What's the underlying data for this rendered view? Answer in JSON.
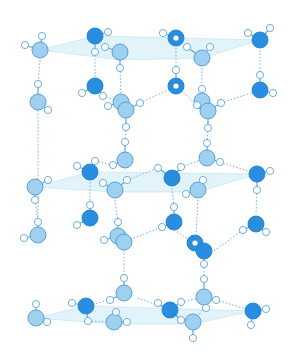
{
  "diagram": {
    "title": "",
    "colors": {
      "oxygen_light": "#9fd0ef",
      "oxygen_dark": "#2a8ee0",
      "hydrogen": "#ffffff",
      "bond_stroke": "#5ea6dd",
      "hbond_dashed": "#7fb3dc",
      "plane_fill": "#bfe6f5"
    },
    "planes": [
      {
        "points": "40,50 95,36 260,40 202,58 120,60"
      },
      {
        "points": "35,187 90,172 257,174 198,192 115,192"
      },
      {
        "points": "36,318 86,306 253,311 193,324 114,324"
      }
    ],
    "molecules": [
      {
        "id": "A1",
        "kind": "light",
        "o": [
          40,
          50
        ],
        "h": [
          [
            25,
            45
          ],
          [
            42,
            36
          ]
        ]
      },
      {
        "id": "A2",
        "kind": "dark",
        "o": [
          95,
          36
        ],
        "h": [
          [
            108,
            32
          ],
          [
            95,
            52
          ]
        ]
      },
      {
        "id": "A3",
        "kind": "light",
        "o": [
          120,
          52
        ],
        "h": [
          [
            105,
            47
          ],
          [
            120,
            68
          ]
        ]
      },
      {
        "id": "A4",
        "kind": "dark",
        "o": [
          176,
          38
        ],
        "h": [
          [
            163,
            33
          ]
        ],
        "hole": true
      },
      {
        "id": "A5",
        "kind": "light",
        "o": [
          202,
          58
        ],
        "h": [
          [
            187,
            47
          ],
          [
            210,
            47
          ]
        ]
      },
      {
        "id": "A6",
        "kind": "dark",
        "o": [
          260,
          40
        ],
        "h": [
          [
            248,
            33
          ],
          [
            270,
            28
          ]
        ]
      },
      {
        "id": "B1",
        "kind": "light",
        "o": [
          38,
          102
        ],
        "h": [
          [
            38,
            84
          ],
          [
            48,
            110
          ]
        ]
      },
      {
        "id": "B2",
        "kind": "dark",
        "o": [
          95,
          86
        ],
        "h": [
          [
            82,
            93
          ],
          [
            103,
            96
          ]
        ]
      },
      {
        "id": "B3",
        "kind": "dark",
        "o": [
          176,
          86
        ],
        "h": [
          [
            176,
            70
          ]
        ],
        "hole": true
      },
      {
        "id": "B4",
        "kind": "dark",
        "o": [
          260,
          90
        ],
        "h": [
          [
            260,
            75
          ],
          [
            273,
            93
          ]
        ]
      },
      {
        "id": "B5a",
        "kind": "light",
        "o": [
          121,
          102
        ],
        "h": [
          [
            108,
            106
          ]
        ]
      },
      {
        "id": "B5b",
        "kind": "light",
        "o": [
          126,
          110
        ],
        "h": [
          [
            140,
            103
          ],
          [
            126,
            127
          ]
        ]
      },
      {
        "id": "B6a",
        "kind": "light",
        "o": [
          202,
          101
        ],
        "h": [
          [
            202,
            89
          ],
          [
            197,
            105
          ]
        ]
      },
      {
        "id": "B6b",
        "kind": "light",
        "o": [
          208,
          111
        ],
        "h": [
          [
            221,
            103
          ],
          [
            208,
            128
          ]
        ]
      },
      {
        "id": "C1",
        "kind": "light",
        "o": [
          125,
          160
        ],
        "h": [
          [
            113,
            165
          ],
          [
            125,
            142
          ]
        ]
      },
      {
        "id": "C2",
        "kind": "light",
        "o": [
          207,
          158
        ],
        "h": [
          [
            207,
            143
          ],
          [
            220,
            162
          ]
        ]
      },
      {
        "id": "C3",
        "kind": "dark",
        "o": [
          90,
          172
        ],
        "h": [
          [
            77,
            166
          ],
          [
            95,
            161
          ]
        ]
      },
      {
        "id": "C4",
        "kind": "dark",
        "o": [
          172,
          178
        ],
        "h": [
          [
            158,
            168
          ],
          [
            181,
            167
          ]
        ]
      },
      {
        "id": "C5",
        "kind": "light",
        "o": [
          35,
          187
        ],
        "h": [
          [
            48,
            180
          ],
          [
            35,
            200
          ]
        ]
      },
      {
        "id": "C6",
        "kind": "light",
        "o": [
          115,
          190
        ],
        "h": [
          [
            103,
            183
          ],
          [
            127,
            180
          ]
        ]
      },
      {
        "id": "C7",
        "kind": "light",
        "o": [
          198,
          190
        ],
        "h": [
          [
            186,
            194
          ],
          [
            203,
            180
          ]
        ]
      },
      {
        "id": "C8",
        "kind": "dark",
        "o": [
          257,
          174
        ],
        "h": [
          [
            270,
            171
          ],
          [
            257,
            190
          ]
        ]
      },
      {
        "id": "D1",
        "kind": "dark",
        "o": [
          90,
          218
        ],
        "h": [
          [
            77,
            225
          ],
          [
            90,
            205
          ]
        ]
      },
      {
        "id": "D2",
        "kind": "dark",
        "o": [
          174,
          222
        ],
        "h": [
          [
            162,
            227
          ],
          [
            174,
            207
          ]
        ]
      },
      {
        "id": "D3",
        "kind": "dark",
        "o": [
          256,
          224
        ],
        "h": [
          [
            243,
            230
          ],
          [
            266,
            232
          ]
        ]
      },
      {
        "id": "D4",
        "kind": "light",
        "o": [
          38,
          235
        ],
        "h": [
          [
            24,
            238
          ],
          [
            38,
            222
          ]
        ]
      },
      {
        "id": "D5a",
        "kind": "light",
        "o": [
          118,
          236
        ],
        "h": [
          [
            104,
            240
          ],
          [
            118,
            222
          ]
        ]
      },
      {
        "id": "D5b",
        "kind": "light",
        "o": [
          124,
          242
        ],
        "h": []
      },
      {
        "id": "D6a",
        "kind": "dark",
        "o": [
          195,
          243
        ],
        "h": [],
        "hole": true
      },
      {
        "id": "D6b",
        "kind": "dark",
        "o": [
          204,
          251
        ],
        "h": [
          [
            204,
            264
          ]
        ]
      },
      {
        "id": "E1",
        "kind": "light",
        "o": [
          124,
          293
        ],
        "h": [
          [
            124,
            278
          ],
          [
            110,
            300
          ]
        ]
      },
      {
        "id": "E2",
        "kind": "dark",
        "o": [
          86,
          306
        ],
        "h": [
          [
            72,
            303
          ],
          [
            88,
            321
          ]
        ]
      },
      {
        "id": "E3",
        "kind": "light",
        "o": [
          204,
          297
        ],
        "h": [
          [
            204,
            279
          ],
          [
            216,
            300
          ],
          [
            206,
            308
          ]
        ]
      },
      {
        "id": "E4",
        "kind": "dark",
        "o": [
          170,
          310
        ],
        "h": [
          [
            158,
            303
          ],
          [
            181,
            302
          ],
          [
            181,
            320
          ]
        ]
      },
      {
        "id": "E5",
        "kind": "light",
        "o": [
          36,
          318
        ],
        "h": [
          [
            36,
            304
          ],
          [
            47,
            322
          ]
        ]
      },
      {
        "id": "E6",
        "kind": "light",
        "o": [
          114,
          322
        ],
        "h": [
          [
            116,
            312
          ],
          [
            127,
            322
          ]
        ]
      },
      {
        "id": "E7",
        "kind": "light",
        "o": [
          193,
          322
        ],
        "h": [
          [
            193,
            338
          ]
        ]
      },
      {
        "id": "E8",
        "kind": "dark",
        "o": [
          253,
          311
        ],
        "h": [
          [
            266,
            309
          ],
          [
            251,
            325
          ]
        ]
      }
    ],
    "hbonds": [
      [
        42,
        36,
        40,
        50
      ],
      [
        40,
        60,
        38,
        84
      ],
      [
        95,
        52,
        95,
        72
      ],
      [
        95,
        72,
        95,
        86
      ],
      [
        120,
        68,
        121,
        95
      ],
      [
        176,
        48,
        176,
        70
      ],
      [
        210,
        47,
        202,
        58
      ],
      [
        202,
        68,
        202,
        89
      ],
      [
        260,
        50,
        260,
        75
      ],
      [
        140,
        103,
        176,
        86
      ],
      [
        176,
        86,
        197,
        105
      ],
      [
        221,
        103,
        260,
        90
      ],
      [
        126,
        127,
        125,
        142
      ],
      [
        208,
        128,
        207,
        143
      ],
      [
        103,
        96,
        121,
        102
      ],
      [
        95,
        161,
        113,
        165
      ],
      [
        127,
        180,
        158,
        168
      ],
      [
        181,
        167,
        207,
        158
      ],
      [
        220,
        162,
        257,
        174
      ],
      [
        38,
        110,
        38,
        222
      ],
      [
        35,
        200,
        38,
        222
      ],
      [
        90,
        182,
        90,
        205
      ],
      [
        115,
        200,
        118,
        222
      ],
      [
        172,
        188,
        174,
        207
      ],
      [
        198,
        200,
        196,
        234
      ],
      [
        257,
        190,
        256,
        214
      ],
      [
        124,
        242,
        162,
        227
      ],
      [
        174,
        230,
        195,
        243
      ],
      [
        214,
        251,
        243,
        230
      ],
      [
        124,
        250,
        124,
        278
      ],
      [
        204,
        264,
        204,
        279
      ],
      [
        88,
        321,
        114,
        322
      ],
      [
        138,
        298,
        170,
        310
      ],
      [
        181,
        302,
        204,
        297
      ],
      [
        216,
        300,
        253,
        311
      ],
      [
        193,
        322,
        204,
        308
      ],
      [
        86,
        306,
        110,
        300
      ]
    ]
  }
}
